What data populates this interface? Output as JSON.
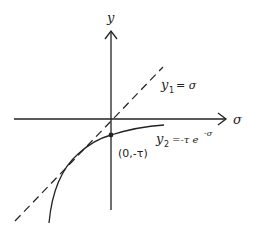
{
  "diagram": {
    "axes": {
      "y_label": "y",
      "x_label": "σ"
    },
    "lines": {
      "y1": {
        "name": "y",
        "sub": "1",
        "eq": "= σ",
        "style": "dashed"
      },
      "y2": {
        "name": "y",
        "sub": "2",
        "eq": "=-τ e",
        "exp": "-σ",
        "style": "solid"
      }
    },
    "point": {
      "label": "(0,-τ)"
    },
    "colors": {
      "ink": "#222222",
      "background": "#ffffff"
    }
  }
}
